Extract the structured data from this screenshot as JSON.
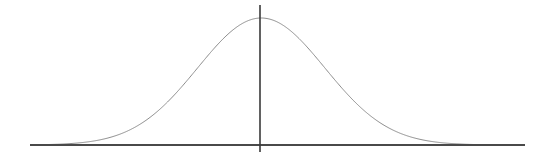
{
  "figure": {
    "width": 545,
    "height": 162,
    "background_color": "#ffffff",
    "title": "",
    "caption": ""
  },
  "style": {
    "curve_color": "#8c8c8c",
    "curve_width": 1,
    "axis_color": "#4a4a4a",
    "axis_width": 2,
    "mean_line_color": "#3a3a3a",
    "mean_line_width": 1.6
  },
  "geometry": {
    "axis_y": 145,
    "axis_x_start": 30,
    "axis_x_end": 525,
    "mean_x": 260,
    "mean_line_y_top": 5,
    "mean_line_y_bottom": 152,
    "peak_y": 18,
    "sigma_px": 64,
    "curve_x_start": 32,
    "curve_x_end": 500
  },
  "chart_data": {
    "type": "line",
    "title": "",
    "subtitle": "",
    "xlabel": "",
    "ylabel": "",
    "grid": false,
    "legend": null,
    "legend_position": "none",
    "distribution": "normal",
    "mean": 0,
    "std_dev": 1,
    "peak_value": 1,
    "baseline_value": 0,
    "xlim": [
      -3.6,
      3.75
    ],
    "ylim": [
      0,
      1.1
    ],
    "xticks": [],
    "yticks": [],
    "xticklabels": [],
    "yticklabels": [],
    "annotations": [
      {
        "name": "mean-vertical-line",
        "type": "vline",
        "x": 0,
        "label": ""
      }
    ],
    "series": [
      {
        "name": "normal-pdf",
        "color": "#8c8c8c",
        "x": [
          -3.6,
          -3.45,
          -3.3,
          -3.15,
          -3.0,
          -2.85,
          -2.7,
          -2.55,
          -2.4,
          -2.25,
          -2.1,
          -1.95,
          -1.8,
          -1.65,
          -1.5,
          -1.35,
          -1.2,
          -1.05,
          -0.9,
          -0.75,
          -0.6,
          -0.45,
          -0.3,
          -0.15,
          0.0,
          0.15,
          0.3,
          0.45,
          0.6,
          0.75,
          0.9,
          1.05,
          1.2,
          1.35,
          1.5,
          1.65,
          1.8,
          1.95,
          2.1,
          2.25,
          2.4,
          2.55,
          2.7,
          2.85,
          3.0,
          3.15,
          3.3,
          3.45,
          3.6,
          3.75
        ],
        "y": [
          0.0015,
          0.0029,
          0.0048,
          0.0077,
          0.0111,
          0.017,
          0.0255,
          0.0382,
          0.0561,
          0.0796,
          0.1109,
          0.1496,
          0.1979,
          0.2567,
          0.3247,
          0.4025,
          0.4868,
          0.5769,
          0.667,
          0.7548,
          0.8353,
          0.9042,
          0.956,
          0.9888,
          1.0,
          0.9888,
          0.956,
          0.9042,
          0.8353,
          0.7548,
          0.667,
          0.5769,
          0.4868,
          0.4025,
          0.3247,
          0.2567,
          0.1979,
          0.1496,
          0.1109,
          0.0796,
          0.0561,
          0.0382,
          0.0255,
          0.017,
          0.0111,
          0.0077,
          0.0048,
          0.0029,
          0.0015,
          0.0009
        ]
      }
    ]
  }
}
